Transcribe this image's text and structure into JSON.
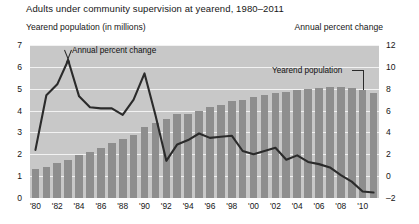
{
  "title": "Adults under community supervision at yearend, 1980–2011",
  "axis_captions": {
    "left": "Yearend population (in millions)",
    "right": "Annual percent change"
  },
  "annotations": {
    "line_series": "Annual percent change",
    "bar_series": "Yearend population"
  },
  "colors": {
    "plot_background": "#c8c8c8",
    "bar": "#8e8e8e",
    "line": "#2b2b2b",
    "gridline": "#f2f2f2",
    "text": "#161616"
  },
  "chart_data": {
    "type": "bar",
    "title": "Adults under community supervision at yearend, 1980–2011",
    "xlabel": "",
    "ylabel": "Yearend population (in millions)",
    "y2label": "Annual percent change",
    "ylim": [
      0,
      7
    ],
    "y2lim": [
      -2,
      12
    ],
    "yticks": [
      0,
      1,
      2,
      3,
      4,
      5,
      6,
      7
    ],
    "y2ticks": [
      -2,
      0,
      2,
      4,
      6,
      8,
      10,
      12
    ],
    "grid": true,
    "legend_position": "inline-annotations",
    "categories": [
      "'80",
      "'81",
      "'82",
      "'83",
      "'84",
      "'85",
      "'86",
      "'87",
      "'82x",
      "'89",
      "'90",
      "'91",
      "'92",
      "'93",
      "'94",
      "'95",
      "'96",
      "'97",
      "'98",
      "'99",
      "'00",
      "'01",
      "'02",
      "'03",
      "'04",
      "'05",
      "'06",
      "'07",
      "'08",
      "'09",
      "'10",
      "'11"
    ],
    "x": [
      1980,
      1981,
      1982,
      1983,
      1984,
      1985,
      1986,
      1987,
      1988,
      1989,
      1990,
      1991,
      1992,
      1993,
      1994,
      1995,
      1996,
      1997,
      1998,
      1999,
      2000,
      2001,
      2002,
      2003,
      2004,
      2005,
      2006,
      2007,
      2008,
      2009,
      2010,
      2011
    ],
    "xtick_labels": [
      "'80",
      "'82",
      "'84",
      "'86",
      "'88",
      "'90",
      "'92",
      "'94",
      "'96",
      "'98",
      "'00",
      "'02",
      "'04",
      "'06",
      "'08",
      "'10"
    ],
    "xtick_years": [
      1980,
      1982,
      1984,
      1986,
      1988,
      1990,
      1992,
      1994,
      1996,
      1998,
      2000,
      2002,
      2004,
      2006,
      2008,
      2010
    ],
    "series": [
      {
        "name": "Yearend population",
        "type": "bar",
        "axis": "left",
        "unit": "millions",
        "values": [
          1.34,
          1.44,
          1.58,
          1.75,
          1.95,
          2.12,
          2.28,
          2.52,
          2.7,
          2.9,
          3.25,
          3.45,
          3.62,
          3.85,
          3.85,
          4.0,
          4.15,
          4.25,
          4.45,
          4.5,
          4.6,
          4.7,
          4.8,
          4.85,
          4.95,
          5.0,
          5.05,
          5.1,
          5.1,
          5.05,
          4.95,
          4.82
        ]
      },
      {
        "name": "Annual percent change",
        "type": "line",
        "axis": "right",
        "unit": "percent",
        "values": [
          2.4,
          7.4,
          8.4,
          10.6,
          7.3,
          6.3,
          6.2,
          6.2,
          5.6,
          7.0,
          9.4,
          5.6,
          1.4,
          2.9,
          3.3,
          3.9,
          3.5,
          3.6,
          3.7,
          2.3,
          2.0,
          2.3,
          2.6,
          1.5,
          1.9,
          1.3,
          1.1,
          0.8,
          0.1,
          -0.5,
          -1.4,
          -1.5
        ]
      }
    ]
  }
}
